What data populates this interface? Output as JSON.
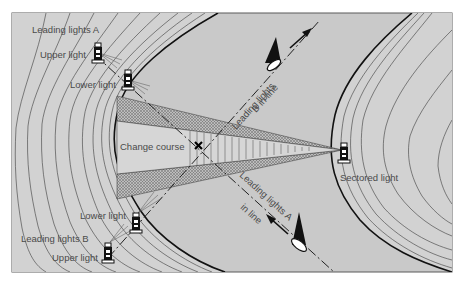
{
  "diagram": {
    "colors": {
      "water": "#c9c9c9",
      "land": "#d2d2d2",
      "contour": "#3a3a3a",
      "shore": "#111111",
      "text": "#4a4a4a",
      "frame": "#5a5a5a"
    },
    "labels": {
      "leading_lights_a": "Leading lights A",
      "upper_light_a": "Upper light",
      "lower_light_a": "Lower light",
      "change_course": "Change course",
      "leading_lights_b_in_line_1": "Leading lights",
      "leading_lights_b_in_line_2": "B in line",
      "leading_lights_a_in_line_1": "Leading lights A",
      "leading_lights_a_in_line_2": "in line",
      "sectored_light": "Sectored light",
      "lower_light_b": "Lower light",
      "leading_lights_b": "Leading lights B",
      "upper_light_b": "Upper light"
    },
    "icons": [
      "lighthouse-icon",
      "sailboat-icon",
      "course-arrow-icon",
      "change-course-marker-icon"
    ]
  }
}
